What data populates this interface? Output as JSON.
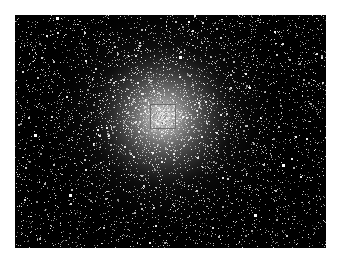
{
  "image": {
    "subject": "globular star cluster",
    "description": "Dense field of stars concentrated toward a bright center on a black sky",
    "colors": {
      "background": "#ffffff",
      "sky": "#000000",
      "stars": "#ffffff",
      "roi_outline": "#5a5a5a"
    }
  },
  "annotation": {
    "type": "rectangle",
    "label": ""
  }
}
